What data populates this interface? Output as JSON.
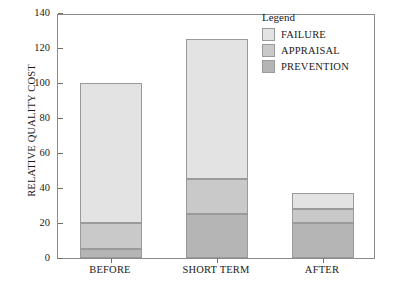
{
  "chart_data": {
    "type": "bar",
    "subtype": "stacked",
    "title": "",
    "xlabel": "",
    "ylabel": "RELATIVE QUALITY COST",
    "categories": [
      "BEFORE",
      "SHORT TERM",
      "AFTER"
    ],
    "series": [
      {
        "name": "PREVENTION",
        "values": [
          5,
          25,
          20
        ],
        "color": "#b5b5b5"
      },
      {
        "name": "APPRAISAL",
        "values": [
          15,
          20,
          8
        ],
        "color": "#c9c9c9"
      },
      {
        "name": "FAILURE",
        "values": [
          80,
          80,
          9
        ],
        "color": "#e3e3e3"
      }
    ],
    "totals": [
      100,
      125,
      37
    ],
    "ylim": [
      0,
      140
    ],
    "yticks": [
      0,
      20,
      40,
      60,
      80,
      100,
      120,
      140
    ],
    "ytick_labels": [
      "0",
      "20",
      "40",
      "60",
      "80",
      "100",
      "120",
      "140"
    ],
    "grid": false,
    "legend": {
      "title": "Legend",
      "position": "top-right",
      "entries": [
        {
          "label": "FAILURE",
          "color": "#e3e3e3"
        },
        {
          "label": "APPRAISAL",
          "color": "#c9c9c9"
        },
        {
          "label": "PREVENTION",
          "color": "#b5b5b5"
        }
      ]
    }
  }
}
